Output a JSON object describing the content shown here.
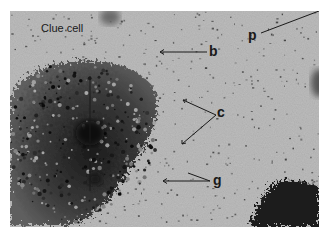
{
  "figure": {
    "labels": {
      "clue_cell": "Clue cell",
      "b": "b",
      "p": "p",
      "c": "c",
      "g": "g"
    },
    "colors": {
      "background": "#b4b4b4",
      "cell_dark": "#1e1e1e",
      "label": "#1a1a1a",
      "border": "#ffffff"
    }
  }
}
